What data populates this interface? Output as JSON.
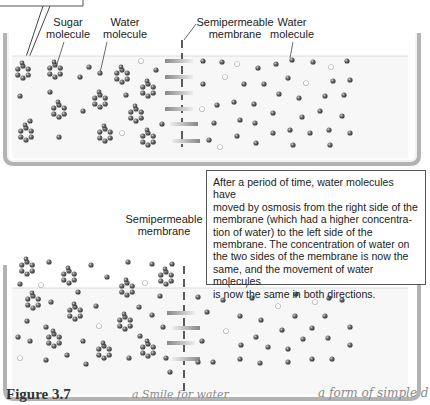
{
  "top_panel": {
    "labels": {
      "sugar_molecule": "Sugar\nmolecule",
      "water_molecule_left": "Water\nmolecule",
      "membrane": "Semipermeable\nmembrane",
      "water_molecule_right": "Water\nmolecule"
    }
  },
  "transition_arrow": {
    "direction": "down",
    "icon": "gradient-down-arrow"
  },
  "bottom_panel": {
    "labels": {
      "membrane": "Semipermeable\nmembrane"
    },
    "callout": "After a period of time, water molecules have moved by osmosis from the right side of the membrane (which had a higher concentration of water) to the left side of the membrane. The concentration of water on the two sides of the membrane is now the same, and the movement of water molecules is now the same in both directions.",
    "callout_lines": [
      "After a period of time, water molecules have",
      "moved by osmosis from the right side of the",
      "membrane (which had a higher concentra-",
      "tion of water) to the left side of the",
      "membrane. The concentration of water on",
      "the two sides of the membrane is now the",
      "same, and the movement of water molecules",
      "is now the same in both directions."
    ]
  },
  "footer": {
    "figure_label": "Figure 3.7",
    "handwritten_note_1": "a Smile for water",
    "handwritten_note_2": "a form of simple d"
  },
  "colors": {
    "container": "#b8b8b8",
    "water_fill": "#f4f4f4",
    "molecule": "#555555",
    "membrane": "#333333",
    "arrow_dark": "#555555",
    "arrow_light": "#e8e8e8"
  }
}
